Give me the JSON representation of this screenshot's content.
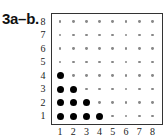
{
  "problem_label": "3a–b.",
  "chart_data": {
    "type": "scatter",
    "title": "",
    "xlabel": "",
    "ylabel": "",
    "xlim": [
      1,
      8
    ],
    "ylim": [
      1,
      8
    ],
    "x_ticks": [
      "1",
      "2",
      "3",
      "4",
      "5",
      "6",
      "7",
      "8"
    ],
    "y_ticks": [
      "1",
      "2",
      "3",
      "4",
      "5",
      "6",
      "7",
      "8"
    ],
    "grid": "dot lattice 8x8 (small gray dots at every integer point)",
    "highlighted_points": [
      {
        "x": 1,
        "y": 1
      },
      {
        "x": 2,
        "y": 1
      },
      {
        "x": 3,
        "y": 1
      },
      {
        "x": 4,
        "y": 1
      },
      {
        "x": 1,
        "y": 2
      },
      {
        "x": 2,
        "y": 2
      },
      {
        "x": 3,
        "y": 2
      },
      {
        "x": 1,
        "y": 3
      },
      {
        "x": 2,
        "y": 3
      },
      {
        "x": 1,
        "y": 4
      }
    ],
    "legend": []
  }
}
